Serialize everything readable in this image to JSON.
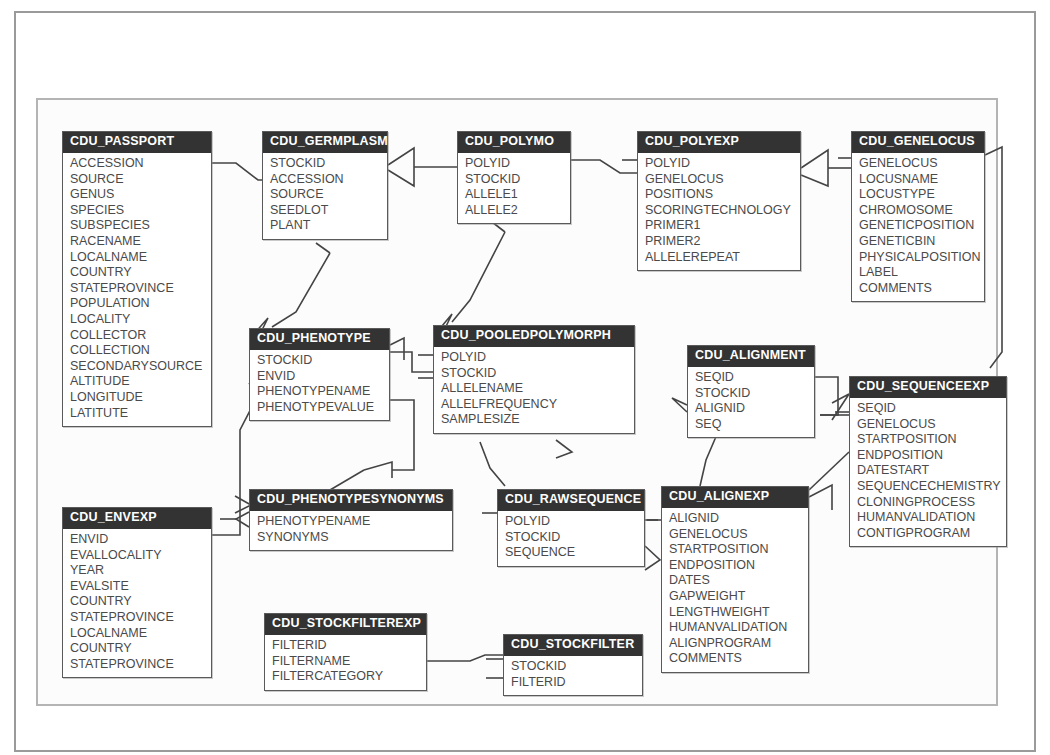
{
  "diagram": {
    "type": "entity-relationship-diagram",
    "title": "",
    "colors": {
      "entity_header_bg": "#333333",
      "entity_header_text": "#ffffff",
      "entity_body_bg": "#ffffff",
      "entity_border": "#5a5a5a",
      "field_text": "#4a4a4a",
      "connector": "#444444",
      "outer_frame": "#9a9a9a",
      "inner_frame": "#b4b4b4",
      "page_bg": "#ffffff"
    },
    "entities": [
      {
        "id": "cdu-passport",
        "name": "CDU_PASSPORT",
        "x": 62,
        "y": 131,
        "width": 150,
        "fields": [
          "ACCESSION",
          "SOURCE",
          "GENUS",
          "SPECIES",
          "SUBSPECIES",
          "RACENAME",
          "LOCALNAME",
          "COUNTRY",
          "STATEPROVINCE",
          "POPULATION",
          "LOCALITY",
          "COLLECTOR",
          "COLLECTION",
          "SECONDARYSOURCE",
          "ALTITUDE",
          "LONGITUDE",
          "LATITUTE"
        ]
      },
      {
        "id": "cdu-envexp",
        "name": "CDU_ENVEXP",
        "x": 62,
        "y": 507,
        "width": 150,
        "fields": [
          "ENVID",
          "EVALLOCALITY",
          "YEAR",
          "EVALSITE",
          "COUNTRY",
          "STATEPROVINCE",
          "LOCALNAME",
          "COUNTRY",
          "STATEPROVINCE"
        ]
      },
      {
        "id": "cdu-germplasm",
        "name": "CDU_GERMPLASM",
        "x": 262,
        "y": 131,
        "width": 126,
        "fields": [
          "STOCKID",
          "ACCESSION",
          "SOURCE",
          "SEEDLOT",
          "PLANT"
        ]
      },
      {
        "id": "cdu-phenotype",
        "name": "CDU_PHENOTYPE",
        "x": 249,
        "y": 328,
        "width": 141,
        "fields": [
          "STOCKID",
          "ENVID",
          "PHENOTYPENAME",
          "PHENOTYPEVALUE"
        ]
      },
      {
        "id": "cdu-phenotypesynonyms",
        "name": "CDU_PHENOTYPESYNONYMS",
        "x": 249,
        "y": 489,
        "width": 204,
        "fields": [
          "PHENOTYPENAME",
          "SYNONYMS"
        ]
      },
      {
        "id": "cdu-stockfilterexp",
        "name": "CDU_STOCKFILTEREXP",
        "x": 264,
        "y": 613,
        "width": 163,
        "fields": [
          "FILTERID",
          "FILTERNAME",
          "FILTERCATEGORY"
        ]
      },
      {
        "id": "cdu-polymo",
        "name": "CDU_POLYMO",
        "x": 457,
        "y": 131,
        "width": 114,
        "fields": [
          "POLYID",
          "STOCKID",
          "ALLELE1",
          "ALLELE2"
        ]
      },
      {
        "id": "cdu-pooledpolymorph",
        "name": "CDU_POOLEDPOLYMORPH",
        "x": 433,
        "y": 325,
        "width": 202,
        "fields": [
          "POLYID",
          "STOCKID",
          "ALLELENAME",
          "ALLELFREQUENCY",
          "SAMPLESIZE"
        ]
      },
      {
        "id": "cdu-rawsequence",
        "name": "CDU_RAWSEQUENCE",
        "x": 497,
        "y": 489,
        "width": 148,
        "fields": [
          "POLYID",
          "STOCKID",
          "SEQUENCE"
        ]
      },
      {
        "id": "cdu-stockfilter",
        "name": "CDU_STOCKFILTER",
        "x": 503,
        "y": 634,
        "width": 140,
        "fields": [
          "STOCKID",
          "FILTERID"
        ]
      },
      {
        "id": "cdu-polyexp",
        "name": "CDU_POLYEXP",
        "x": 637,
        "y": 131,
        "width": 164,
        "fields": [
          "POLYID",
          "GENELOCUS",
          "POSITIONS",
          "SCORINGTECHNOLOGY",
          "PRIMER1",
          "PRIMER2",
          "ALLELEREPEAT"
        ]
      },
      {
        "id": "cdu-alignment",
        "name": "CDU_ALIGNMENT",
        "x": 687,
        "y": 345,
        "width": 128,
        "fields": [
          "SEQID",
          "STOCKID",
          "ALIGNID",
          "SEQ"
        ]
      },
      {
        "id": "cdu-alignexp",
        "name": "CDU_ALIGNEXP",
        "x": 661,
        "y": 486,
        "width": 148,
        "fields": [
          "ALIGNID",
          "GENELOCUS",
          "STARTPOSITION",
          "ENDPOSITION",
          "DATES",
          "GAPWEIGHT",
          "LENGTHWEIGHT",
          "HUMANVALIDATION",
          "ALIGNPROGRAM",
          "COMMENTS"
        ]
      },
      {
        "id": "cdu-genelocus",
        "name": "CDU_GENELOCUS",
        "x": 851,
        "y": 131,
        "width": 134,
        "fields": [
          "GENELOCUS",
          "LOCUSNAME",
          "LOCUSTYPE",
          "CHROMOSOME",
          "GENETICPOSITION",
          "GENETICBIN",
          "PHYSICALPOSITION",
          "LABEL",
          "COMMENTS"
        ]
      },
      {
        "id": "cdu-sequenceexp",
        "name": "CDU_SEQUENCEEXP",
        "x": 849,
        "y": 376,
        "width": 158,
        "fields": [
          "SEQID",
          "GENELOCUS",
          "STARTPOSITION",
          "ENDPOSITION",
          "DATESTART",
          "SEQUENCECHEMISTRY",
          "CLONINGPROCESS",
          "HUMANVALIDATION",
          "CONTIGPROGRAM"
        ]
      }
    ],
    "relationships": [
      {
        "from": "cdu-passport",
        "to": "cdu-germplasm",
        "label": ""
      },
      {
        "from": "cdu-germplasm",
        "to": "cdu-polymo",
        "label": ""
      },
      {
        "from": "cdu-germplasm",
        "to": "cdu-phenotype",
        "label": ""
      },
      {
        "from": "cdu-polymo",
        "to": "cdu-polyexp",
        "label": ""
      },
      {
        "from": "cdu-polymo",
        "to": "cdu-pooledpolymorph",
        "label": ""
      },
      {
        "from": "cdu-polyexp",
        "to": "cdu-genelocus",
        "label": ""
      },
      {
        "from": "cdu-phenotype",
        "to": "cdu-pooledpolymorph",
        "label": ""
      },
      {
        "from": "cdu-phenotype",
        "to": "cdu-phenotypesynonyms",
        "label": ""
      },
      {
        "from": "cdu-envexp",
        "to": "cdu-phenotype",
        "label": ""
      },
      {
        "from": "cdu-pooledpolymorph",
        "to": "cdu-rawsequence",
        "label": ""
      },
      {
        "from": "cdu-alignment",
        "to": "cdu-sequenceexp",
        "label": ""
      },
      {
        "from": "cdu-alignment",
        "to": "cdu-alignexp",
        "label": ""
      },
      {
        "from": "cdu-rawsequence",
        "to": "cdu-alignexp",
        "label": ""
      },
      {
        "from": "cdu-alignexp",
        "to": "cdu-sequenceexp",
        "label": ""
      },
      {
        "from": "cdu-genelocus",
        "to": "cdu-sequenceexp",
        "label": ""
      },
      {
        "from": "cdu-stockfilterexp",
        "to": "cdu-stockfilter",
        "label": ""
      },
      {
        "from": "cdu-stockfilter",
        "to": "cdu-alignexp",
        "label": ""
      }
    ]
  }
}
